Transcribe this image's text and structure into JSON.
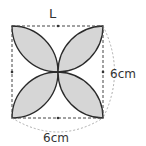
{
  "diagram": {
    "title_letter": "L",
    "right_label": "6cm",
    "bottom_label": "6cm",
    "colors": {
      "petal_fill": "#d6d6d6",
      "stroke": "#2a2a2a",
      "dashed": "#444444",
      "dimension_arc": "#999999"
    }
  }
}
